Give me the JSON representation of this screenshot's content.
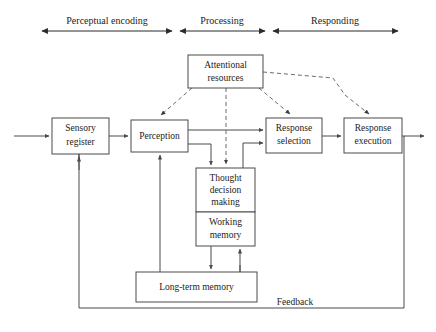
{
  "diagram": {
    "colors": {
      "background": "#ffffff",
      "box_stroke": "#4a4a4a",
      "solid_connector": "#4a4a4a",
      "dashed_connector": "#6b6b6b",
      "phase_arrow": "#2b2b2b",
      "text": "#1c1c1c"
    },
    "phases": [
      {
        "id": "perceptual-encoding",
        "label": "Perceptual encoding",
        "x1": 42,
        "x2": 172,
        "label_x": 107,
        "label_y": 20,
        "line_y": 31
      },
      {
        "id": "processing",
        "label": "Processing",
        "x1": 180,
        "x2": 265,
        "label_x": 222,
        "label_y": 20,
        "line_y": 31
      },
      {
        "id": "responding",
        "label": "Responding",
        "x1": 273,
        "x2": 398,
        "label_x": 335,
        "label_y": 20,
        "line_y": 31
      }
    ],
    "boxes": [
      {
        "id": "sensory-register",
        "lines": [
          "Sensory",
          "register"
        ],
        "x": 52,
        "y": 118,
        "w": 57,
        "h": 36
      },
      {
        "id": "perception",
        "lines": [
          "Perception"
        ],
        "x": 131,
        "y": 120,
        "w": 57,
        "h": 32
      },
      {
        "id": "attentional-resources",
        "lines": [
          "Attentional",
          "resources"
        ],
        "x": 188,
        "y": 55,
        "w": 75,
        "h": 33
      },
      {
        "id": "thought-decision-making",
        "lines": [
          "Thought",
          "decision",
          "making"
        ],
        "x": 196,
        "y": 168,
        "w": 59,
        "h": 44
      },
      {
        "id": "working-memory",
        "lines": [
          "Working",
          "memory"
        ],
        "x": 196,
        "y": 212,
        "w": 59,
        "h": 34
      },
      {
        "id": "long-term-memory",
        "lines": [
          "Long-term memory"
        ],
        "x": 136,
        "y": 272,
        "w": 121,
        "h": 30
      },
      {
        "id": "response-selection",
        "lines": [
          "Response",
          "selection"
        ],
        "x": 266,
        "y": 118,
        "w": 56,
        "h": 35
      },
      {
        "id": "response-execution",
        "lines": [
          "Response",
          "execution"
        ],
        "x": 344,
        "y": 118,
        "w": 58,
        "h": 35
      }
    ],
    "feedback": {
      "label": "Feedback",
      "label_x": 295,
      "label_y": 304,
      "line_y": 308,
      "x1": 79,
      "x2": 404
    },
    "outer_frame": {
      "x": 26,
      "y": 44,
      "w": 384,
      "h": 267
    }
  }
}
